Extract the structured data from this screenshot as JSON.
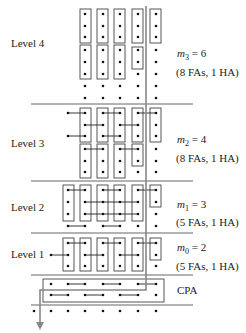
{
  "levels": [
    {
      "name": "Level 4",
      "m_var": "m",
      "m_sub": "3",
      "m_val": "= 6",
      "counts": "(8 FAs, 1 HA)"
    },
    {
      "name": "Level 3",
      "m_var": "m",
      "m_sub": "2",
      "m_val": "= 4",
      "counts": "(8 FAs, 1 HA)"
    },
    {
      "name": "Level 2",
      "m_var": "m",
      "m_sub": "1",
      "m_val": "= 3",
      "counts": "(5 FAs, 1 HA)"
    },
    {
      "name": "Level 1",
      "m_var": "m",
      "m_sub": "0",
      "m_val": "= 2",
      "counts": "(5 FAs, 1 HA)"
    }
  ],
  "cpa_label": "CPA",
  "colors": {
    "line": "#555555",
    "dot": "#111111",
    "box": "#444444",
    "arrow": "#888888"
  }
}
